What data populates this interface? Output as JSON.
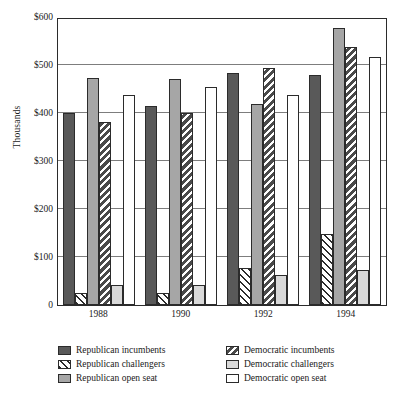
{
  "chart_data": {
    "type": "bar",
    "title": "",
    "subtitle": "",
    "xlabel": "",
    "ylabel": "Thousands",
    "categories": [
      "1988",
      "1990",
      "1992",
      "1994"
    ],
    "ylim": [
      0,
      600
    ],
    "ytick_values": [
      0,
      100,
      200,
      300,
      400,
      500,
      600
    ],
    "ytick_labels": [
      "0",
      "$100",
      "$200",
      "$300",
      "$400",
      "$500",
      "$600"
    ],
    "grid": true,
    "legend_position": "bottom",
    "legend_columns": 2,
    "series": [
      {
        "name": "Republican incumbents",
        "pattern": "solid-dark-gray",
        "color": "#595959",
        "values": [
          400,
          415,
          483,
          480
        ]
      },
      {
        "name": "Republican challengers",
        "pattern": "white-backslash-hatch",
        "color": "#ffffff",
        "values": [
          25,
          25,
          78,
          147
        ]
      },
      {
        "name": "Republican open seat",
        "pattern": "solid-medium-gray",
        "color": "#a6a6a6",
        "values": [
          472,
          470,
          418,
          577
        ]
      },
      {
        "name": "Democratic incumbents",
        "pattern": "dark-forward-hatch",
        "color": "#6e6e6e",
        "values": [
          381,
          400,
          493,
          537
        ]
      },
      {
        "name": "Democratic challengers",
        "pattern": "solid-light-gray",
        "color": "#d9d9d9",
        "values": [
          42,
          42,
          62,
          73
        ]
      },
      {
        "name": "Democratic open seat",
        "pattern": "white",
        "color": "#ffffff",
        "values": [
          437,
          455,
          437,
          516
        ]
      }
    ]
  },
  "legend": {
    "items": [
      {
        "label": "Republican incumbents",
        "swatch": "s0"
      },
      {
        "label": "Democratic incumbents",
        "swatch": "s3"
      },
      {
        "label": "Republican challengers",
        "swatch": "s1"
      },
      {
        "label": "Democratic challengers",
        "swatch": "s4"
      },
      {
        "label": "Republican open seat",
        "swatch": "s2"
      },
      {
        "label": "Democratic open seat",
        "swatch": "s5"
      }
    ]
  }
}
